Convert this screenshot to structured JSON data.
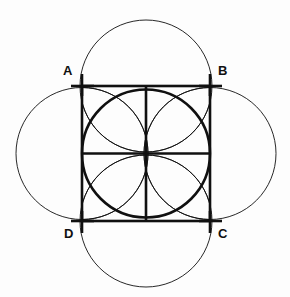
{
  "figure": {
    "kind": "geometric-construction",
    "background_color": "#fdfdfd",
    "stroke_color": "#101010",
    "bold_stroke_width": 2.6,
    "thin_stroke_width": 0.9,
    "labels": [
      {
        "id": "A",
        "text": "A",
        "x": 63,
        "y": 64
      },
      {
        "id": "B",
        "text": "B",
        "x": 218,
        "y": 64
      },
      {
        "id": "C",
        "text": "C",
        "x": 218,
        "y": 227
      },
      {
        "id": "D",
        "text": "D",
        "x": 64,
        "y": 227
      }
    ],
    "square": {
      "left": 82,
      "top": 86,
      "right": 210,
      "bottom": 221,
      "width": 128,
      "height": 135,
      "vertices": {
        "A": [
          82,
          86
        ],
        "B": [
          210,
          86
        ],
        "C": [
          210,
          221
        ],
        "D": [
          82,
          221
        ]
      }
    },
    "center": [
      146,
      153.5
    ],
    "midpoints": {
      "top": [
        146,
        86
      ],
      "right": [
        210,
        153.5
      ],
      "bottom": [
        146,
        221
      ],
      "left": [
        82,
        153.5
      ]
    },
    "inscribed_circle": {
      "cx": 146,
      "cy": 153.5,
      "r": 64
    },
    "outer_circles": [
      {
        "id": "top-circle",
        "cx": 146,
        "cy": 86,
        "r": 66
      },
      {
        "id": "left-circle",
        "cx": 82,
        "cy": 153.5,
        "r": 66
      },
      {
        "id": "right-circle",
        "cx": 210,
        "cy": 153.5,
        "r": 66
      },
      {
        "id": "bottom-circle",
        "cx": 146,
        "cy": 221,
        "r": 66
      }
    ],
    "median_lines": [
      {
        "id": "vertical-median",
        "x1": 146,
        "y1": 86,
        "x2": 146,
        "y2": 221
      },
      {
        "id": "horizontal-median",
        "x1": 82,
        "y1": 153.5,
        "x2": 210,
        "y2": 153.5
      }
    ],
    "corner_ticks": [
      {
        "id": "tick-A-vertical",
        "x1": 82,
        "y1": 74,
        "x2": 82,
        "y2": 96
      },
      {
        "id": "tick-A-horizontal",
        "x1": 71,
        "y1": 86,
        "x2": 94,
        "y2": 86
      },
      {
        "id": "tick-B-vertical",
        "x1": 210,
        "y1": 74,
        "x2": 210,
        "y2": 96
      },
      {
        "id": "tick-B-horizontal",
        "x1": 199,
        "y1": 86,
        "x2": 222,
        "y2": 86
      },
      {
        "id": "tick-C-vertical",
        "x1": 210,
        "y1": 211,
        "x2": 210,
        "y2": 233
      },
      {
        "id": "tick-C-horizontal",
        "x1": 199,
        "y1": 221,
        "x2": 222,
        "y2": 221
      },
      {
        "id": "tick-D-vertical",
        "x1": 82,
        "y1": 211,
        "x2": 82,
        "y2": 233
      },
      {
        "id": "tick-D-horizontal",
        "x1": 71,
        "y1": 221,
        "x2": 94,
        "y2": 221
      }
    ]
  }
}
